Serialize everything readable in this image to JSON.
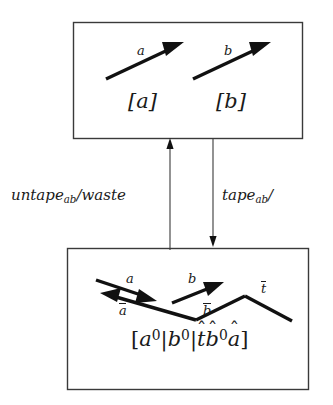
{
  "figure": {
    "type": "state-transition-diagram",
    "background_color": "#ffffff",
    "ink_color": "#111111",
    "box_stroke_color": "#3a3a3a"
  },
  "top_box": {
    "name": "upper-state-box",
    "arrows": [
      {
        "label": "a",
        "direction": "right-up"
      },
      {
        "label": "b",
        "direction": "right-up"
      }
    ],
    "state_labels": [
      "[a]",
      "[b]"
    ],
    "label_a": "a",
    "label_b": "b",
    "state_a": "[a]",
    "state_b": "[b]"
  },
  "bottom_box": {
    "name": "lower-state-box",
    "arrow_labels": {
      "a": "a",
      "a_bar": "ā",
      "b": "b",
      "b_bar": "b̄",
      "t_bar": "t̄"
    },
    "state_label_plain": "[a0|b0|t̂b̂0â]",
    "state_label_parts": {
      "open_bracket": "[",
      "term1_base": "a",
      "term1_sup": "0",
      "bar1": "|",
      "term2_base": "b",
      "term2_sup": "0",
      "bar2": "|",
      "term3_base": "t",
      "term3_hat": "ˆ",
      "term4_base": "b",
      "term4_hat": "ˆ",
      "term4_sup": "0",
      "term5_base": "a",
      "term5_hat": "ˆ",
      "close_bracket": "]"
    }
  },
  "transitions": {
    "left": {
      "name": "untape-transition",
      "label_base": "untape",
      "label_sub": "ab",
      "label_tail": "/waste",
      "full_label": "untape_ab/waste",
      "direction": "up"
    },
    "right": {
      "name": "tape-transition",
      "label_base": "tape",
      "label_sub": "ab",
      "label_tail": "/",
      "full_label": "tape_ab/",
      "direction": "down"
    }
  }
}
